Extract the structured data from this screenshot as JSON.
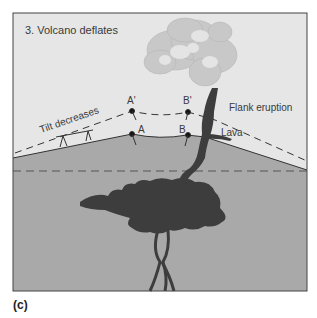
{
  "figure": {
    "title": "3. Volcano deflates",
    "panel_label": "(c)",
    "labels": {
      "tilt": "Tilt decreases",
      "a_prime": "A'",
      "b_prime": "B'",
      "a": "A",
      "b": "B",
      "flank_eruption": "Flank eruption",
      "lava": "Lava"
    },
    "colors": {
      "sky": "#e6e6e6",
      "ground": "#a9a9a9",
      "magma": "#3d3d3d",
      "plume": "#c8c8c8",
      "frame": "#444444"
    }
  }
}
